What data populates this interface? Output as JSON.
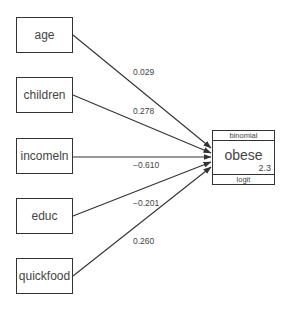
{
  "diagram": {
    "type": "path-diagram",
    "predictors": [
      {
        "id": "age",
        "label": "age",
        "coefficient": "0.029"
      },
      {
        "id": "children",
        "label": "children",
        "coefficient": "0.278"
      },
      {
        "id": "incomeln",
        "label": "incomeln",
        "coefficient": "−0.610"
      },
      {
        "id": "educ",
        "label": "educ",
        "coefficient": "−0.201"
      },
      {
        "id": "quickfood",
        "label": "quickfood",
        "coefficient": "0.260"
      }
    ],
    "outcome": {
      "label": "obese",
      "family": "binomial",
      "link": "logit",
      "constant": "2.3"
    },
    "colors": {
      "stroke": "#333333",
      "text": "#444444",
      "background": "#ffffff"
    }
  }
}
